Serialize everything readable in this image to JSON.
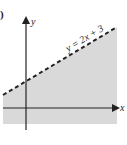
{
  "figure": {
    "part_label": ")",
    "x_axis_label": "x",
    "y_axis_label": "y",
    "boundary_label": "y = 2x + 3",
    "boundary_style": "dashed",
    "shaded_region": "below boundary",
    "colors": {
      "shade": "#d9d9d9",
      "axis": "#222222",
      "boundary": "#222222"
    }
  }
}
